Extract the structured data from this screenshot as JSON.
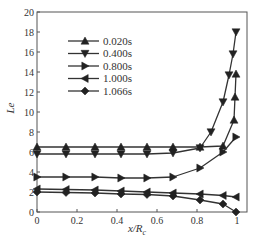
{
  "chart_data": {
    "type": "line",
    "title": "",
    "xlabel": "x/Rc",
    "ylabel": "Le",
    "xlim": [
      0,
      1
    ],
    "ylim": [
      0,
      20
    ],
    "xticks": [
      0,
      0.2,
      0.4,
      0.6,
      0.8,
      1
    ],
    "xtick_labels": [
      "0",
      "0.2",
      "0.4",
      "0.6",
      "0.8",
      "1"
    ],
    "yticks": [
      0,
      2,
      4,
      6,
      8,
      10,
      12,
      14,
      16,
      18,
      20
    ],
    "ytick_labels": [
      "0",
      "2",
      "4",
      "6",
      "8",
      "10",
      "12",
      "14",
      "16",
      "18",
      "20"
    ],
    "grid": false,
    "legend_position": "upper-left-inside",
    "series": [
      {
        "name": "0.020s",
        "marker": "triangle-up",
        "x": [
          0,
          0.145,
          0.29,
          0.42,
          0.55,
          0.68,
          0.815,
          0.93,
          0.985,
          0.99,
          0.995
        ],
        "y": [
          6.5,
          6.5,
          6.5,
          6.5,
          6.5,
          6.5,
          6.5,
          6.6,
          9.2,
          11.5,
          13.8
        ]
      },
      {
        "name": "0.400s",
        "marker": "triangle-down",
        "x": [
          0,
          0.145,
          0.29,
          0.42,
          0.55,
          0.68,
          0.815,
          0.87,
          0.93,
          0.96,
          0.98,
          0.995
        ],
        "y": [
          5.8,
          5.8,
          5.8,
          5.8,
          5.8,
          5.9,
          6.4,
          8.0,
          11.0,
          13.7,
          15.8,
          18.0
        ]
      },
      {
        "name": "0.800s",
        "marker": "triangle-right",
        "x": [
          0,
          0.145,
          0.29,
          0.42,
          0.55,
          0.68,
          0.815,
          0.93,
          0.995
        ],
        "y": [
          3.5,
          3.5,
          3.5,
          3.4,
          3.4,
          3.5,
          4.4,
          6.0,
          7.5
        ]
      },
      {
        "name": "1.000s",
        "marker": "triangle-left",
        "x": [
          0,
          0.145,
          0.29,
          0.42,
          0.55,
          0.68,
          0.815,
          0.93,
          0.995
        ],
        "y": [
          2.3,
          2.25,
          2.2,
          2.1,
          2.0,
          1.9,
          1.8,
          1.65,
          1.5
        ]
      },
      {
        "name": "1.066s",
        "marker": "diamond",
        "x": [
          0,
          0.145,
          0.29,
          0.42,
          0.55,
          0.68,
          0.815,
          0.93,
          0.995
        ],
        "y": [
          2.0,
          1.95,
          1.9,
          1.8,
          1.75,
          1.6,
          1.2,
          0.8,
          0.0
        ]
      }
    ]
  },
  "legend": {
    "items": [
      "0.020s",
      "0.400s",
      "0.800s",
      "1.000s",
      "1.066s"
    ]
  },
  "axes": {
    "xlabel_main": "x/R",
    "xlabel_sub": "c",
    "ylabel": "Le"
  }
}
